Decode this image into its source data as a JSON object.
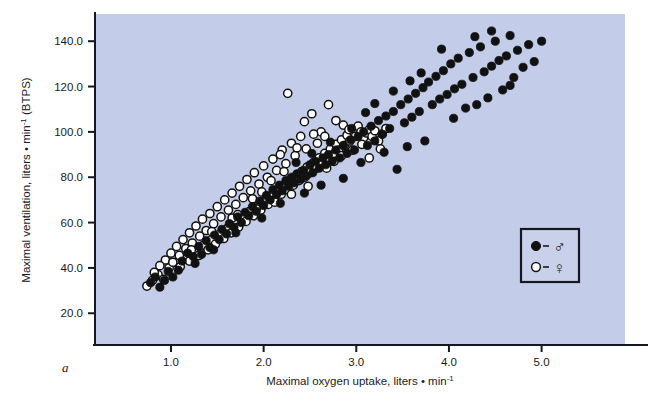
{
  "figure": {
    "panel_label": "a",
    "background_color": "#ffffff",
    "plot_area_color": "#c3cce8",
    "axis_color": "#16181f"
  },
  "legend": {
    "border_color": "#16181f",
    "background_color": "#c9d1ea",
    "entries": [
      {
        "marker": "filled-circle",
        "symbol": "♂",
        "label": "male",
        "color": "#111111"
      },
      {
        "marker": "open-circle",
        "symbol": "♀",
        "label": "female",
        "color": "#ffffff"
      }
    ]
  },
  "chart_data": {
    "type": "scatter",
    "title": "",
    "xlabel": "Maximal oxygen uptake, liters • min-1",
    "xlabel_parts": {
      "text": "Maximal oxygen uptake, liters • min",
      "sup": "-1"
    },
    "ylabel": "Maximal ventilation, liters • min-1 (BTPS)",
    "ylabel_parts": {
      "pre": "Maximal ventilation, liters • min",
      "sup": "-1",
      "post": " (BTPS)"
    },
    "xlim": [
      0.18,
      5.9
    ],
    "ylim": [
      6.0,
      152.0
    ],
    "xticks": [
      1.0,
      2.0,
      3.0,
      4.0,
      5.0
    ],
    "xtick_labels": [
      "1.0",
      "2.0",
      "3.0",
      "4.0",
      "5.0"
    ],
    "yticks": [
      20.0,
      40.0,
      60.0,
      80.0,
      100.0,
      120.0,
      140.0
    ],
    "ytick_labels": [
      "20.0",
      "40.0",
      "60.0",
      "80.0",
      "100.0",
      "120.0",
      "140.0"
    ],
    "grid": false,
    "legend_position": "lower-right",
    "marker_radius_px": 4.1,
    "series": [
      {
        "name": "male",
        "symbol": "♂",
        "marker": "filled-circle",
        "fill": "#111111",
        "stroke": "#111111",
        "points": [
          [
            0.78,
            33.5
          ],
          [
            0.83,
            36.0
          ],
          [
            0.88,
            31.5
          ],
          [
            0.97,
            38.5
          ],
          [
            1.02,
            36.0
          ],
          [
            1.12,
            43.0
          ],
          [
            1.18,
            46.5
          ],
          [
            1.24,
            45.0
          ],
          [
            1.3,
            49.5
          ],
          [
            1.33,
            46.0
          ],
          [
            1.38,
            52.0
          ],
          [
            1.42,
            49.0
          ],
          [
            1.47,
            54.5
          ],
          [
            1.52,
            52.5
          ],
          [
            1.55,
            57.0
          ],
          [
            1.6,
            55.0
          ],
          [
            1.63,
            59.5
          ],
          [
            1.68,
            58.0
          ],
          [
            1.72,
            62.5
          ],
          [
            1.76,
            60.0
          ],
          [
            1.8,
            64.5
          ],
          [
            1.84,
            63.0
          ],
          [
            1.88,
            67.0
          ],
          [
            1.92,
            65.0
          ],
          [
            1.96,
            69.5
          ],
          [
            2.0,
            67.5
          ],
          [
            2.03,
            72.0
          ],
          [
            2.07,
            70.0
          ],
          [
            2.1,
            74.5
          ],
          [
            2.14,
            72.5
          ],
          [
            2.17,
            76.5
          ],
          [
            2.2,
            74.0
          ],
          [
            2.24,
            78.5
          ],
          [
            2.27,
            76.0
          ],
          [
            2.3,
            80.0
          ],
          [
            2.33,
            77.5
          ],
          [
            2.36,
            81.5
          ],
          [
            2.4,
            79.0
          ],
          [
            2.43,
            83.0
          ],
          [
            2.46,
            80.5
          ],
          [
            2.5,
            85.5
          ],
          [
            2.53,
            82.0
          ],
          [
            2.56,
            87.0
          ],
          [
            2.6,
            84.0
          ],
          [
            2.64,
            88.5
          ],
          [
            2.67,
            85.5
          ],
          [
            2.7,
            90.0
          ],
          [
            2.74,
            87.0
          ],
          [
            2.78,
            92.0
          ],
          [
            2.82,
            88.5
          ],
          [
            2.86,
            94.0
          ],
          [
            2.9,
            90.5
          ],
          [
            2.94,
            96.5
          ],
          [
            2.98,
            92.0
          ],
          [
            3.02,
            98.0
          ],
          [
            3.05,
            86.5
          ],
          [
            3.08,
            100.0
          ],
          [
            3.12,
            94.0
          ],
          [
            3.16,
            102.5
          ],
          [
            3.2,
            96.0
          ],
          [
            3.24,
            105.0
          ],
          [
            3.28,
            99.0
          ],
          [
            3.32,
            107.0
          ],
          [
            3.36,
            101.5
          ],
          [
            3.4,
            109.0
          ],
          [
            3.44,
            83.5
          ],
          [
            3.48,
            112.0
          ],
          [
            3.52,
            104.0
          ],
          [
            3.56,
            114.5
          ],
          [
            3.6,
            106.5
          ],
          [
            3.64,
            117.0
          ],
          [
            3.68,
            109.0
          ],
          [
            3.72,
            119.5
          ],
          [
            3.74,
            96.0
          ],
          [
            3.78,
            122.0
          ],
          [
            3.82,
            112.0
          ],
          [
            3.86,
            124.5
          ],
          [
            3.9,
            114.5
          ],
          [
            3.94,
            127.0
          ],
          [
            3.98,
            116.5
          ],
          [
            4.02,
            130.0
          ],
          [
            4.06,
            119.0
          ],
          [
            4.1,
            132.5
          ],
          [
            4.14,
            121.0
          ],
          [
            4.18,
            110.5
          ],
          [
            4.22,
            135.0
          ],
          [
            4.26,
            124.0
          ],
          [
            4.3,
            112.0
          ],
          [
            4.34,
            137.5
          ],
          [
            4.38,
            126.5
          ],
          [
            4.42,
            115.0
          ],
          [
            4.46,
            129.0
          ],
          [
            4.5,
            140.0
          ],
          [
            4.54,
            131.5
          ],
          [
            4.58,
            118.5
          ],
          [
            4.62,
            133.5
          ],
          [
            4.66,
            142.5
          ],
          [
            4.7,
            124.0
          ],
          [
            4.74,
            136.0
          ],
          [
            4.8,
            128.5
          ],
          [
            4.86,
            138.5
          ],
          [
            4.92,
            131.0
          ],
          [
            5.0,
            140.0
          ],
          [
            3.3,
            91.0
          ],
          [
            3.55,
            93.5
          ],
          [
            2.86,
            79.5
          ],
          [
            2.62,
            76.5
          ],
          [
            2.44,
            73.0
          ],
          [
            2.18,
            68.5
          ],
          [
            1.98,
            62.0
          ],
          [
            1.7,
            55.5
          ],
          [
            1.46,
            48.0
          ],
          [
            1.26,
            42.0
          ],
          [
            1.08,
            39.0
          ],
          [
            0.93,
            34.5
          ],
          [
            3.1,
            108.5
          ],
          [
            3.4,
            118.0
          ],
          [
            3.7,
            126.0
          ],
          [
            4.05,
            106.0
          ],
          [
            4.28,
            142.0
          ],
          [
            4.46,
            144.5
          ],
          [
            4.66,
            120.5
          ],
          [
            3.92,
            136.5
          ],
          [
            3.58,
            122.5
          ],
          [
            3.2,
            112.5
          ],
          [
            2.95,
            101.5
          ],
          [
            2.72,
            95.5
          ],
          [
            2.52,
            90.5
          ],
          [
            2.35,
            86.5
          ]
        ]
      },
      {
        "name": "female",
        "symbol": "♀",
        "marker": "open-circle",
        "fill": "#ffffff",
        "stroke": "#111111",
        "points": [
          [
            0.74,
            32.0
          ],
          [
            0.8,
            34.5
          ],
          [
            0.86,
            37.0
          ],
          [
            0.92,
            35.0
          ],
          [
            0.98,
            40.0
          ],
          [
            1.05,
            42.5
          ],
          [
            1.1,
            40.5
          ],
          [
            1.15,
            45.0
          ],
          [
            1.2,
            43.0
          ],
          [
            1.25,
            47.5
          ],
          [
            1.3,
            45.5
          ],
          [
            1.35,
            50.0
          ],
          [
            1.4,
            48.0
          ],
          [
            1.44,
            52.5
          ],
          [
            1.48,
            50.5
          ],
          [
            1.53,
            55.0
          ],
          [
            1.57,
            53.0
          ],
          [
            1.61,
            57.5
          ],
          [
            1.65,
            55.5
          ],
          [
            1.69,
            60.0
          ],
          [
            1.73,
            58.0
          ],
          [
            1.77,
            62.5
          ],
          [
            1.81,
            60.5
          ],
          [
            1.85,
            65.0
          ],
          [
            1.89,
            63.0
          ],
          [
            1.93,
            67.0
          ],
          [
            1.97,
            65.5
          ],
          [
            2.01,
            69.5
          ],
          [
            2.05,
            68.0
          ],
          [
            2.09,
            72.0
          ],
          [
            2.12,
            70.0
          ],
          [
            2.16,
            74.5
          ],
          [
            2.19,
            72.5
          ],
          [
            2.23,
            76.5
          ],
          [
            2.26,
            74.5
          ],
          [
            2.29,
            78.5
          ],
          [
            2.32,
            76.5
          ],
          [
            2.35,
            80.5
          ],
          [
            2.38,
            78.5
          ],
          [
            2.41,
            82.5
          ],
          [
            2.44,
            80.0
          ],
          [
            2.47,
            84.5
          ],
          [
            2.5,
            82.0
          ],
          [
            2.54,
            86.5
          ],
          [
            2.57,
            84.0
          ],
          [
            2.6,
            88.5
          ],
          [
            2.63,
            86.0
          ],
          [
            2.66,
            90.5
          ],
          [
            2.69,
            88.0
          ],
          [
            2.72,
            92.5
          ],
          [
            2.75,
            90.0
          ],
          [
            2.78,
            94.5
          ],
          [
            2.81,
            92.0
          ],
          [
            2.84,
            96.5
          ],
          [
            2.87,
            94.0
          ],
          [
            2.9,
            98.5
          ],
          [
            2.93,
            96.0
          ],
          [
            2.96,
            100.5
          ],
          [
            2.99,
            98.0
          ],
          [
            3.02,
            102.5
          ],
          [
            3.05,
            100.0
          ],
          [
            3.08,
            97.5
          ],
          [
            3.11,
            99.5
          ],
          [
            3.14,
            101.0
          ],
          [
            3.17,
            98.0
          ],
          [
            3.2,
            100.5
          ],
          [
            3.24,
            96.0
          ],
          [
            3.28,
            99.0
          ],
          [
            3.32,
            101.5
          ],
          [
            2.52,
            108.0
          ],
          [
            2.7,
            112.0
          ],
          [
            2.78,
            105.0
          ],
          [
            2.62,
            100.0
          ],
          [
            2.4,
            98.0
          ],
          [
            2.3,
            95.0
          ],
          [
            2.2,
            92.0
          ],
          [
            2.1,
            88.0
          ],
          [
            2.0,
            85.0
          ],
          [
            1.9,
            82.0
          ],
          [
            1.82,
            79.0
          ],
          [
            1.74,
            76.0
          ],
          [
            1.66,
            73.0
          ],
          [
            1.58,
            70.0
          ],
          [
            1.5,
            67.0
          ],
          [
            1.42,
            64.0
          ],
          [
            1.34,
            61.5
          ],
          [
            1.27,
            58.5
          ],
          [
            1.2,
            55.5
          ],
          [
            1.13,
            52.5
          ],
          [
            1.06,
            49.5
          ],
          [
            1.0,
            46.5
          ],
          [
            0.94,
            43.5
          ],
          [
            0.88,
            41.0
          ],
          [
            0.82,
            38.0
          ],
          [
            2.44,
            104.5
          ],
          [
            2.86,
            103.0
          ],
          [
            2.58,
            95.0
          ],
          [
            2.46,
            92.5
          ],
          [
            2.34,
            89.5
          ],
          [
            2.24,
            86.0
          ],
          [
            2.14,
            83.0
          ],
          [
            2.04,
            80.0
          ],
          [
            1.95,
            77.0
          ],
          [
            1.86,
            74.0
          ],
          [
            1.78,
            71.0
          ],
          [
            1.7,
            68.0
          ],
          [
            1.62,
            65.5
          ],
          [
            1.54,
            62.5
          ],
          [
            1.46,
            59.5
          ],
          [
            1.38,
            56.5
          ],
          [
            1.31,
            54.0
          ],
          [
            1.23,
            51.0
          ],
          [
            1.16,
            48.5
          ],
          [
            1.09,
            45.5
          ],
          [
            1.02,
            42.5
          ],
          [
            2.26,
            117.0
          ],
          [
            2.08,
            78.5
          ],
          [
            2.22,
            82.5
          ],
          [
            2.66,
            98.0
          ],
          [
            2.92,
            101.0
          ],
          [
            3.06,
            94.5
          ],
          [
            2.54,
            99.0
          ],
          [
            2.36,
            93.0
          ],
          [
            2.18,
            90.0
          ],
          [
            1.98,
            73.5
          ],
          [
            1.88,
            70.5
          ],
          [
            1.66,
            62.0
          ],
          [
            1.44,
            56.0
          ],
          [
            1.22,
            48.0
          ],
          [
            2.68,
            84.0
          ],
          [
            2.76,
            87.0
          ],
          [
            2.84,
            89.5
          ],
          [
            2.96,
            92.0
          ],
          [
            3.14,
            88.5
          ],
          [
            3.26,
            92.5
          ],
          [
            2.48,
            76.0
          ],
          [
            2.3,
            72.5
          ],
          [
            2.12,
            69.0
          ],
          [
            1.92,
            66.0
          ],
          [
            1.72,
            63.5
          ]
        ]
      }
    ]
  }
}
